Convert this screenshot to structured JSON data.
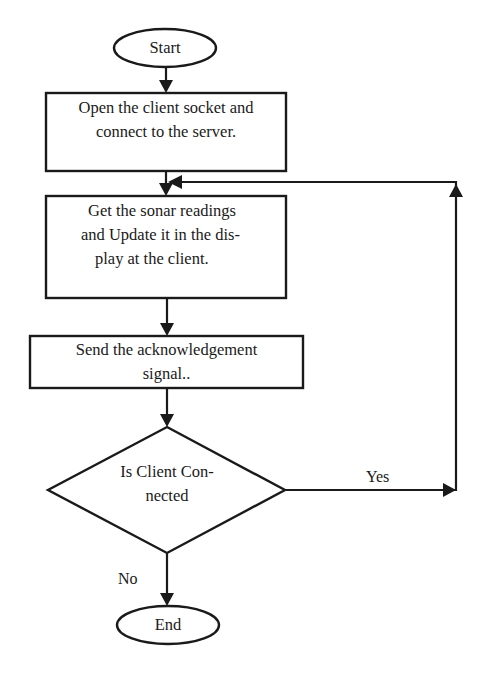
{
  "diagram": {
    "type": "flowchart",
    "nodes": {
      "start": {
        "shape": "terminator",
        "label": "Start"
      },
      "open_socket": {
        "shape": "process",
        "lines": [
          "Open the client socket and",
          "connect to the server."
        ]
      },
      "get_readings": {
        "shape": "process",
        "lines": [
          "Get the sonar readings",
          "and Update it in the dis-",
          "play at the client."
        ]
      },
      "send_ack": {
        "shape": "process",
        "lines": [
          "Send the acknowledgement",
          "signal.."
        ]
      },
      "is_connected": {
        "shape": "decision",
        "lines": [
          "Is Client Con-",
          "nected"
        ]
      },
      "end": {
        "shape": "terminator",
        "label": "End"
      }
    },
    "edges": [
      {
        "from": "start",
        "to": "open_socket",
        "label": ""
      },
      {
        "from": "open_socket",
        "to": "get_readings",
        "label": ""
      },
      {
        "from": "get_readings",
        "to": "send_ack",
        "label": ""
      },
      {
        "from": "send_ack",
        "to": "is_connected",
        "label": ""
      },
      {
        "from": "is_connected",
        "to": "get_readings",
        "label": "Yes"
      },
      {
        "from": "is_connected",
        "to": "end",
        "label": "No"
      }
    ],
    "edge_labels": {
      "yes": "Yes",
      "no": "No"
    },
    "colors": {
      "stroke": "#1a1a1a",
      "fill": "#ffffff",
      "background": "#ffffff"
    }
  }
}
